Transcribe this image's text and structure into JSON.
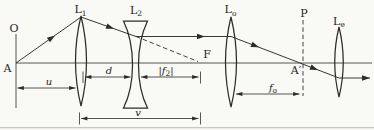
{
  "figure": {
    "ink_color": "#2e2c29",
    "text_color": "#262421",
    "paper_color": "#f9f9f5"
  },
  "labels": {
    "object_top": "O",
    "object_point": "A",
    "lens1": {
      "base": "L",
      "sub": "1"
    },
    "lens2": {
      "base": "L",
      "sub": "2"
    },
    "focal_point": "F",
    "objective_lens": {
      "base": "L",
      "sub": "o"
    },
    "focal_plane": "P",
    "image_point": "A′",
    "eyepiece_lens": {
      "base": "L",
      "sub": "e"
    }
  },
  "dimensions": {
    "u": "u",
    "d": "d",
    "f2": {
      "open": "|",
      "base": "f",
      "sub": "2",
      "close": "|"
    },
    "v": "v",
    "fo": {
      "base": "f",
      "sub": "o"
    }
  }
}
